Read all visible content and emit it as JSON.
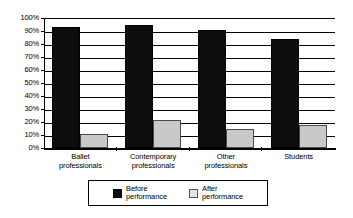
{
  "chart_data": {
    "type": "bar",
    "title": "",
    "subtitle": "",
    "xlabel": "",
    "ylabel": "",
    "ylim": [
      0,
      100
    ],
    "grid": true,
    "legend_position": "bottom-center",
    "categories": [
      "Ballet\nprofessionals",
      "Contemporary\nprofessionals",
      "Other\nprofessionals",
      "Students"
    ],
    "ytick_labels": [
      "100%",
      "90%",
      "80%",
      "70%",
      "60%",
      "50%",
      "40%",
      "30%",
      "20%",
      "10%",
      "0%"
    ],
    "ytick_values": [
      100,
      90,
      80,
      70,
      60,
      50,
      40,
      30,
      20,
      10,
      0
    ],
    "series": [
      {
        "name": "Before\nperformance",
        "color": "#0d0d0d",
        "values": [
          93,
          95,
          90.5,
          84
        ]
      },
      {
        "name": "After\nperformance",
        "color": "#c9c9c9",
        "values": [
          10.5,
          21.5,
          14.5,
          18
        ]
      }
    ]
  },
  "legend": {
    "items": [
      {
        "label": "Before\nperformance",
        "swatch": "black-square"
      },
      {
        "label": "After\nperformance",
        "swatch": "light-gray-square"
      }
    ]
  }
}
